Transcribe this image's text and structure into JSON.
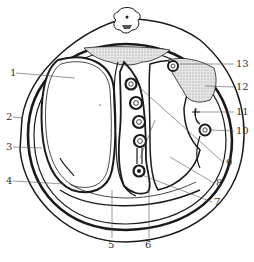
{
  "diagram": {
    "type": "anatomical cross-section",
    "colors": {
      "line": "#1a1a1a",
      "label": "#333333",
      "fill_dotted": "#bdbdbd",
      "background": "#ffffff"
    },
    "labels": [
      {
        "id": "1",
        "text": "1",
        "x": 10,
        "y": 68,
        "tx": 75,
        "ty": 78
      },
      {
        "id": "2",
        "text": "2",
        "x": 6,
        "y": 112,
        "tx": 22,
        "ty": 118
      },
      {
        "id": "3",
        "text": "3",
        "x": 6,
        "y": 142,
        "tx": 42,
        "ty": 148
      },
      {
        "id": "4",
        "text": "4",
        "x": 6,
        "y": 176,
        "tx": 64,
        "ty": 184
      },
      {
        "id": "5",
        "text": "5",
        "x": 108,
        "y": 240,
        "tx": 112,
        "ty": 190
      },
      {
        "id": "6",
        "text": "6",
        "x": 145,
        "y": 240,
        "tx": 149,
        "ty": 188
      },
      {
        "id": "7",
        "text": "7",
        "x": 214,
        "y": 197,
        "tx": 142,
        "ty": 175
      },
      {
        "id": "8",
        "text": "8",
        "x": 216,
        "y": 178,
        "tx": 170,
        "ty": 157
      },
      {
        "id": "9",
        "text": "9",
        "x": 226,
        "y": 158,
        "tx": 140,
        "ty": 88
      },
      {
        "id": "10",
        "text": "10",
        "x": 236,
        "y": 126,
        "tx": 210,
        "ty": 130
      },
      {
        "id": "11",
        "text": "11",
        "x": 236,
        "y": 107,
        "tx": 196,
        "ty": 112
      },
      {
        "id": "12",
        "text": "12",
        "x": 236,
        "y": 82,
        "tx": 205,
        "ty": 86
      },
      {
        "id": "13",
        "text": "13",
        "x": 236,
        "y": 59,
        "tx": 180,
        "ty": 64
      }
    ]
  }
}
